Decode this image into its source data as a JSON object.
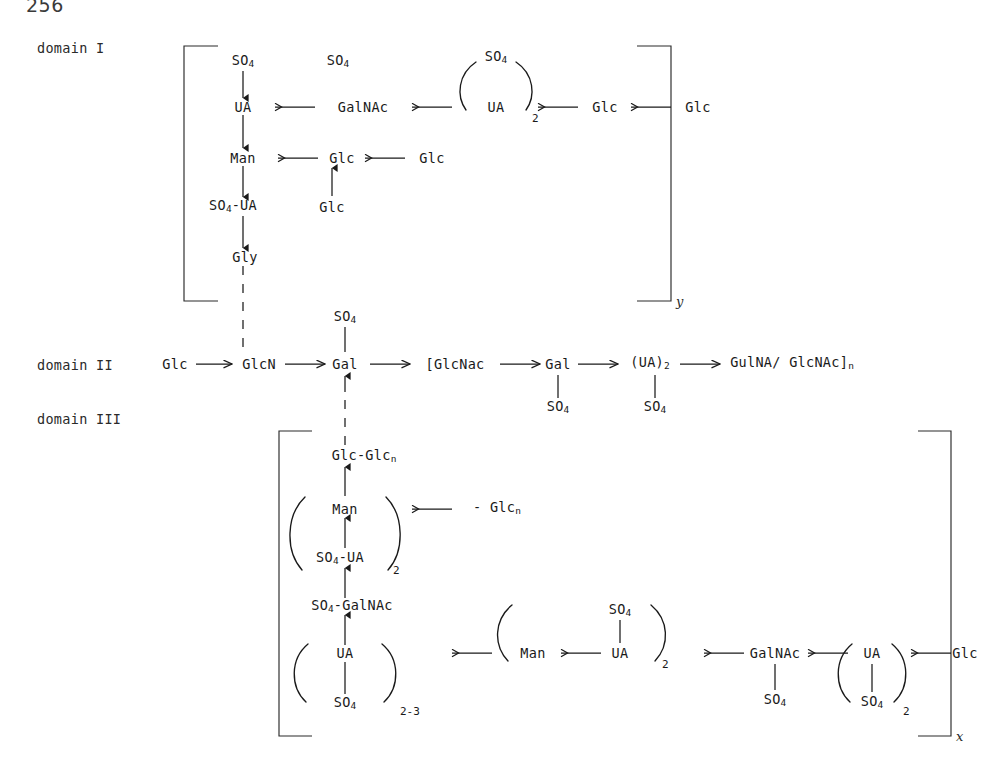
{
  "page": {
    "number": "256"
  },
  "domains": {
    "one": {
      "label": "domain I",
      "bracket_subscript": "y"
    },
    "two": {
      "label": "domain II"
    },
    "three": {
      "label": "domain III",
      "bracket_subscript": "x"
    }
  },
  "residues": {
    "so4": "SO",
    "so4_sub": "4",
    "ua": "UA",
    "man": "Man",
    "glc": "Glc",
    "gly": "Gly",
    "gal": "Gal",
    "glcn": "GlcN",
    "galnac": "GalNAc",
    "glcnac_open": "[GlcNac",
    "gulna_close": "GulNA/ GlcNAc]",
    "n": "n",
    "ua2": "(UA)",
    "ua2_sub": "2",
    "so4_ua": "SO",
    "so4_ua_rest": "-UA",
    "so4_galnac_rest": "-GalNAc",
    "glc_glcn": "Glc-Glc",
    "minus_glcn": "- Glc"
  },
  "domain_one": {
    "top_so4_left": "SO4",
    "top_so4_mid": "SO4",
    "top_so4_paren": "SO4",
    "row1": [
      "UA",
      "GalNAc",
      "UA",
      "Glc",
      "Glc"
    ],
    "row1_group_count": "2",
    "row2": [
      "Man",
      "Glc",
      "Glc"
    ],
    "branch_glc": "Glc",
    "row3": "SO4-UA",
    "row4": "Gly"
  },
  "domain_two": {
    "chain": [
      "Glc",
      "GlcN",
      "Gal",
      "[GlcNac",
      "Gal",
      "(UA)2",
      "GulNA/ GlcNAc]n"
    ],
    "gal_top_so4": "SO4",
    "gal2_so4": "SO4",
    "ua2_so4": "SO4"
  },
  "domain_three": {
    "top": "Glc-Glcn",
    "man": "Man",
    "man_from": "- Glcn",
    "so4_ua": "SO4-UA",
    "so4_ua_count": "2",
    "so4_galnac": "SO4-GalNAc",
    "ua_node": "UA",
    "ua_so4": "SO4",
    "ua_count": "2-3",
    "man2": "Man",
    "ua2": "UA",
    "ua2_so4": "SO4",
    "ua2_count": "2",
    "galnac": "GalNAc",
    "galnac_so4": "SO4",
    "ua3": "UA",
    "ua3_so4": "SO4",
    "ua3_count": "2",
    "glc_end": "Glc"
  },
  "colors": {
    "ink": "#1a1a1a",
    "ink_soft": "#2a2a2a",
    "paper": "#ffffff"
  }
}
